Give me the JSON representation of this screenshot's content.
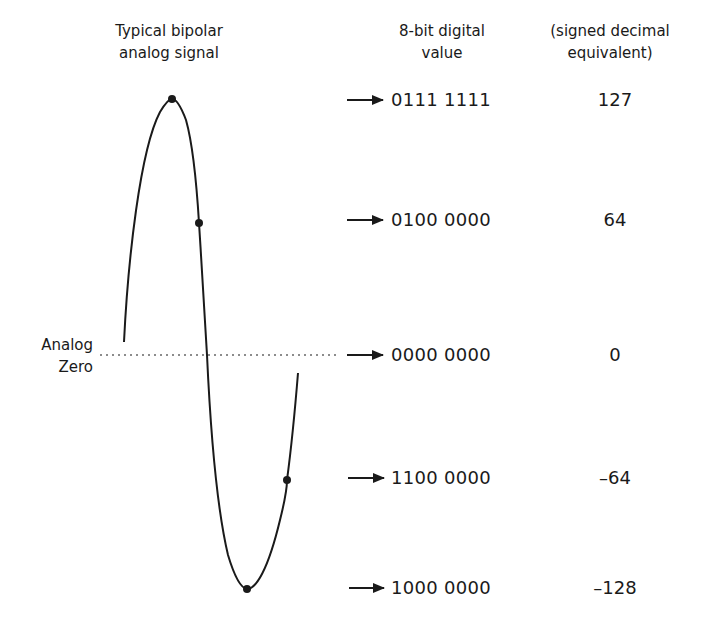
{
  "headers": {
    "signal": [
      "Typical bipolar",
      "analog signal"
    ],
    "digital": [
      "8-bit digital",
      "value"
    ],
    "decimal": [
      "(signed decimal",
      "equivalent)"
    ]
  },
  "zero_label": [
    "Analog",
    "Zero"
  ],
  "rows": [
    {
      "code": "0111 1111",
      "value": "127"
    },
    {
      "code": "0100 0000",
      "value": "64"
    },
    {
      "code": "0000 0000",
      "value": "0"
    },
    {
      "code": "1100 0000",
      "value": "–64"
    },
    {
      "code": "1000 0000",
      "value": "–128"
    }
  ],
  "colors": {
    "ink": "#1a1a1a",
    "background": "#ffffff"
  }
}
